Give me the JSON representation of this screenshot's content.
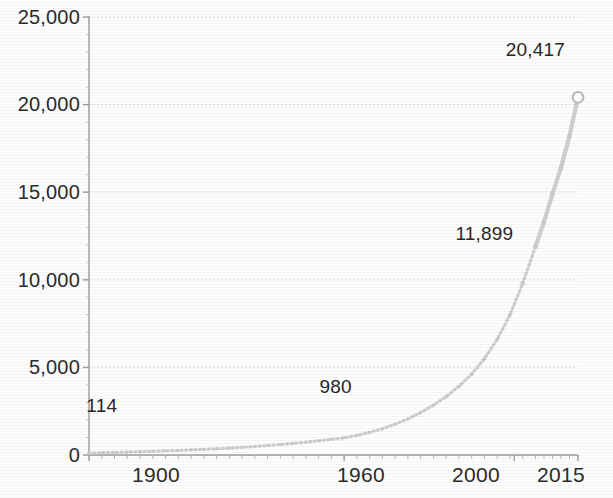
{
  "chart_data": {
    "type": "scatter",
    "title": "",
    "subtitle": "",
    "xlabel": "",
    "ylabel": "",
    "xlim": [
      1900,
      2015
    ],
    "ylim": [
      0,
      25000
    ],
    "grid": true,
    "legend": false,
    "y_ticks": [
      "25,000",
      "20,000",
      "15,000",
      "10,000",
      "5,000",
      "0"
    ],
    "y_tick_values": [
      25000,
      20000,
      15000,
      10000,
      5000,
      0
    ],
    "x_ticks": [
      "1900",
      "1960",
      "2000",
      "2015"
    ],
    "x_tick_values": [
      1900,
      1960,
      2000,
      2015
    ],
    "marker_style": "dotted-small",
    "endpoint_marker": "open-circle",
    "series_color": "#c9c9c9",
    "axis_color": "#9a9a9a",
    "text_color": "#2b2b2b",
    "annotations": [
      {
        "text": "114",
        "x": 1900,
        "y": 114,
        "label_x": 1903,
        "label_y": 2800
      },
      {
        "text": "980",
        "x": 1960,
        "y": 980,
        "label_x": 1958,
        "label_y": 3900
      },
      {
        "text": "11,899",
        "x": 2005,
        "y": 11899,
        "label_x": 1993,
        "label_y": 12600
      },
      {
        "text": "20,417",
        "x": 2015,
        "y": 20417,
        "label_x": 2005,
        "label_y": 23100
      }
    ],
    "x": [
      1900,
      1903,
      1906,
      1909,
      1912,
      1915,
      1918,
      1921,
      1924,
      1927,
      1930,
      1933,
      1936,
      1939,
      1942,
      1945,
      1948,
      1951,
      1954,
      1957,
      1960,
      1963,
      1966,
      1969,
      1972,
      1975,
      1978,
      1981,
      1984,
      1987,
      1990,
      1993,
      1996,
      1999,
      2002,
      2005,
      2007,
      2009,
      2011,
      2013,
      2015
    ],
    "values": [
      114,
      130,
      148,
      168,
      190,
      212,
      236,
      262,
      292,
      324,
      360,
      398,
      440,
      486,
      540,
      600,
      664,
      734,
      812,
      892,
      980,
      1120,
      1290,
      1500,
      1760,
      2060,
      2420,
      2850,
      3340,
      3920,
      4620,
      5500,
      6600,
      8000,
      9800,
      11899,
      13300,
      14900,
      16400,
      18200,
      20417
    ]
  }
}
